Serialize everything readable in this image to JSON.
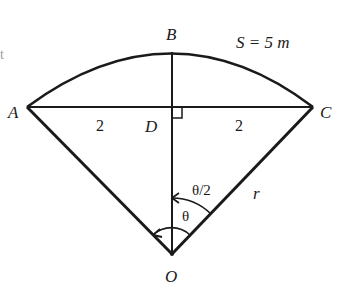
{
  "diagram": {
    "type": "circular-sector geometry",
    "colors": {
      "stroke": "#1a1a1a",
      "background": "#ffffff"
    },
    "points": {
      "A": {
        "label": "A",
        "x": 27,
        "y": 107
      },
      "B": {
        "label": "B",
        "x": 172,
        "y": 52
      },
      "C": {
        "label": "C",
        "x": 313,
        "y": 107
      },
      "D": {
        "label": "D",
        "x": 172,
        "y": 107
      },
      "O": {
        "label": "O",
        "x": 172,
        "y": 254
      }
    },
    "labels": {
      "arc_length": "S = 5 m",
      "half_chord_left": "2",
      "half_chord_right": "2",
      "radius": "r",
      "angle_full": "θ",
      "angle_half": "θ/2",
      "edge_artifact": "t"
    },
    "segments": [
      "OA",
      "OC",
      "AC",
      "OB"
    ],
    "arcs": [
      "AC (through B)"
    ],
    "right_angle_at": "D"
  }
}
